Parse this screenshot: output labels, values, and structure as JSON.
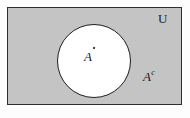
{
  "figure": {
    "type": "venn-diagram",
    "labels": {
      "universe": "U",
      "set": "A",
      "complement_base": "A",
      "complement_superscript": "c"
    },
    "colors": {
      "shaded_region_fill": "#c4c4c4",
      "set_fill": "#ffffff",
      "outline": "#1f1f1f",
      "background": "#fdfdfd",
      "text": "#1a1a1a"
    },
    "regions": [
      {
        "name": "universal-set",
        "shape": "rectangle",
        "label": "U",
        "fill": "#c4c4c4",
        "shaded": true
      },
      {
        "name": "set-a",
        "shape": "circle",
        "label": "A",
        "fill": "#ffffff",
        "shaded": false
      },
      {
        "name": "complement-of-a",
        "shape": "rectangle-minus-circle",
        "label": "Ac",
        "fill": "#c4c4c4",
        "shaded": true
      }
    ]
  }
}
